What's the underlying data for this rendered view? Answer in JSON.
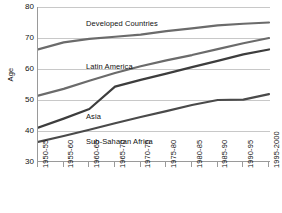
{
  "chart_data": {
    "type": "line",
    "title": "",
    "xlabel": "",
    "ylabel": "Age",
    "ylim": [
      30,
      80
    ],
    "yticks": [
      30,
      40,
      50,
      60,
      70,
      80
    ],
    "grid": true,
    "legend": "inline-series-labels",
    "categories": [
      "1950-55",
      "1955-60",
      "1960-65",
      "1965-70",
      "1970-75",
      "1975-80",
      "1980-85",
      "1985-90",
      "1990-95",
      "1995-2000"
    ],
    "series": [
      {
        "name": "Developed Countries",
        "color": "#6b6b6b",
        "values": [
          66.3,
          68.6,
          69.7,
          70.4,
          71.1,
          72.2,
          73.1,
          74.1,
          74.6,
          75.0
        ]
      },
      {
        "name": "Latin America",
        "color": "#6b6b6b",
        "values": [
          51.4,
          53.6,
          56.2,
          58.7,
          60.9,
          62.8,
          64.5,
          66.4,
          68.3,
          70.0
        ]
      },
      {
        "name": "Asia",
        "color": "#3d3d3d",
        "values": [
          41.1,
          44.0,
          47.1,
          54.3,
          56.5,
          58.5,
          60.6,
          62.6,
          64.7,
          66.3
        ]
      },
      {
        "name": "Sub-Saharan Africa",
        "color": "#4a4a4a",
        "values": [
          36.5,
          38.4,
          40.4,
          42.5,
          44.5,
          46.4,
          48.4,
          50.0,
          50.1,
          51.9
        ]
      }
    ],
    "annotations": [
      {
        "text": "Developed Countries",
        "series": "Developed Countries"
      },
      {
        "text": "Latin America",
        "series": "Latin America"
      },
      {
        "text": "Asia",
        "series": "Asia"
      },
      {
        "text": "Sub-Saharan Africa",
        "series": "Sub-Saharan Africa"
      }
    ]
  },
  "axis": {
    "y_title": "Age",
    "y_tick_labels": [
      "80",
      "70",
      "60",
      "50",
      "40",
      "30"
    ],
    "x_tick_labels": [
      "1950-55",
      "1955-60",
      "1960-65",
      "1965-70",
      "1970-75",
      "1975-80",
      "1980-85",
      "1985-90",
      "1990-95",
      "1995-2000"
    ]
  },
  "labels": {
    "developed_countries": "Developed Countries",
    "latin_america": "Latin America",
    "asia": "Asia",
    "sub_saharan_africa": "Sub-Saharan Africa"
  },
  "colors": {
    "gridline": "#c8c8c8",
    "axis": "#9a9a9a",
    "text": "#111111",
    "line_light": "#6b6b6b",
    "line_dark": "#3d3d3d"
  }
}
